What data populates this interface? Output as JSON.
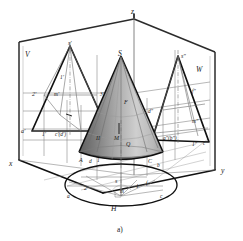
{
  "figure": {
    "caption": "a)"
  },
  "axes": {
    "z": "z",
    "x": "x",
    "y": "y"
  },
  "planes": {
    "vertical": "V",
    "profile": "W",
    "horizontal": "H"
  },
  "solid": {
    "apex": "S",
    "point_f": "F",
    "point_m": "M",
    "region_ii": "II",
    "region_q": "Q",
    "base_a": "A",
    "base_c": "C",
    "base_d": "d",
    "base_b": "b",
    "base_1": "1"
  },
  "front_view": {
    "apex": "s'",
    "labels": [
      "1'",
      "2'",
      "3'",
      "m'",
      "a'",
      "1'",
      "c'(d')"
    ]
  },
  "profile_view": {
    "apex": "s\"",
    "labels": [
      "f\"",
      "m\"",
      "d\"",
      "a\"(b\")",
      "1\"",
      "c\""
    ]
  },
  "top_view": {
    "apex": "s",
    "labels": [
      "2",
      "1",
      "a",
      "c",
      "m",
      "f"
    ]
  },
  "colors": {
    "ink": "#111111",
    "thin_line": "#7d7d7d",
    "cone_dark": "#6e6e6e",
    "cone_mid": "#9c9c9c",
    "cone_light": "#d8d8d8",
    "paper": "#ffffff"
  }
}
